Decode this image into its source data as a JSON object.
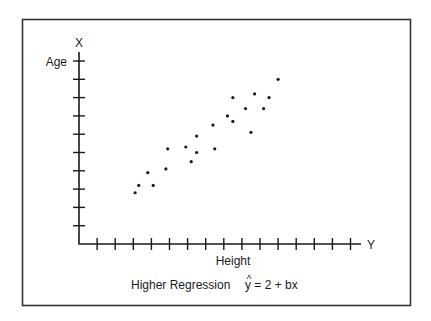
{
  "chart_data": {
    "type": "scatter",
    "title": "",
    "caption": "Higher Regression",
    "equation": {
      "hat": "^",
      "text": "y = 2 + bx"
    },
    "xlabel": "Height",
    "ylabel": "Age",
    "x_axis_letter": "Y",
    "y_axis_letter": "X",
    "x_ticks": 15,
    "y_ticks": 10,
    "xlim": [
      0,
      15.5
    ],
    "ylim": [
      0,
      10.5
    ],
    "grid": false,
    "legend": "none",
    "series": [
      {
        "name": "observations",
        "points": [
          [
            3.1,
            2.8
          ],
          [
            3.3,
            3.2
          ],
          [
            4.1,
            3.2
          ],
          [
            3.8,
            3.9
          ],
          [
            4.8,
            4.1
          ],
          [
            4.9,
            5.2
          ],
          [
            5.9,
            5.3
          ],
          [
            6.2,
            4.5
          ],
          [
            6.5,
            5.0
          ],
          [
            6.5,
            5.9
          ],
          [
            7.5,
            5.2
          ],
          [
            7.4,
            6.5
          ],
          [
            8.5,
            6.7
          ],
          [
            8.2,
            7.0
          ],
          [
            9.5,
            6.1
          ],
          [
            9.2,
            7.4
          ],
          [
            8.5,
            8.0
          ],
          [
            9.7,
            8.2
          ],
          [
            10.2,
            7.4
          ],
          [
            10.5,
            8.0
          ],
          [
            11.0,
            9.0
          ]
        ]
      }
    ],
    "colors": {
      "ink": "#1a1a1a",
      "frame": "#333333",
      "background": "#ffffff"
    }
  }
}
